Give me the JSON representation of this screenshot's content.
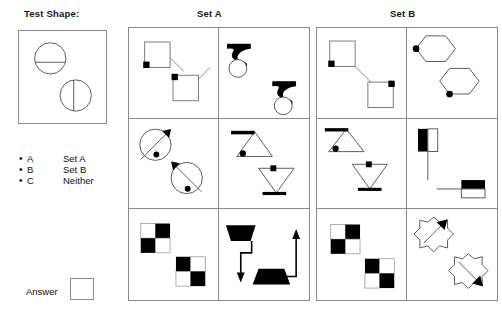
{
  "labels": {
    "test_shape_title": "Test Shape:",
    "set_a_title": "Set A",
    "set_b_title": "Set B",
    "answer_label": "Answer"
  },
  "options": [
    {
      "bullet": "•",
      "letter": "A",
      "text": "Set A"
    },
    {
      "bullet": "•",
      "letter": "B",
      "text": "Set B"
    },
    {
      "bullet": "•",
      "letter": "C",
      "text": "Neither"
    }
  ],
  "answer": {
    "value": ""
  },
  "colors": {
    "stroke": "#8a8a8a",
    "shape_stroke": "#4a4a4a",
    "fill_black": "#000000",
    "fill_white": "#ffffff",
    "text": "#111111",
    "background": "#ffffff"
  },
  "test_shape": {
    "description": "Two circles each divided by a single straight chord line",
    "items": [
      {
        "shape": "circle",
        "divider": "horizontal-chord",
        "position": "upper-left"
      },
      {
        "shape": "circle",
        "divider": "vertical-chord",
        "position": "lower-right"
      }
    ]
  },
  "set_a": {
    "title": "Set A",
    "cells": [
      {
        "id": "a1",
        "shapes": "two open squares, each with a small black square at one corner and a thin diagonal tail line",
        "count": 2
      },
      {
        "id": "a2",
        "shapes": "two solid black hook/lightning glyphs each sitting above an open circle",
        "count": 2
      },
      {
        "id": "a3",
        "shapes": "two circles crossed by a diagonal arrow line with a black dot on the circumference",
        "count": 2
      },
      {
        "id": "a4",
        "shapes": "two triangles (one upright, one inverted) with a thick bar on one side and a black dot at a vertex",
        "count": 2
      },
      {
        "id": "a5",
        "shapes": "two 2x2 checkerboard squares with alternating black and white cells",
        "count": 2
      },
      {
        "id": "a6",
        "shapes": "two solid black trapezoids connected by right-angle arrow lines, one arrow pointing down and one pointing up",
        "count": 2
      }
    ]
  },
  "set_b": {
    "title": "Set B",
    "cells": [
      {
        "id": "b1",
        "shapes": "two open squares with black corner dots joined by a long diagonal connector line",
        "count": 2
      },
      {
        "id": "b2",
        "shapes": "two open hexagons each with a black dot on a vertex",
        "count": 2
      },
      {
        "id": "b3",
        "shapes": "two triangles (one upright, one inverted) with a thick bar on one edge and a black dot at a vertex",
        "count": 2
      },
      {
        "id": "b4",
        "shapes": "two rectangles half filled black with a thin line extending from one side",
        "count": 2
      },
      {
        "id": "b5",
        "shapes": "two 2x2 checkerboard squares with alternating black and white cells",
        "count": 2
      },
      {
        "id": "b6",
        "shapes": "two eight-pointed stars each pierced by a diagonal arrow",
        "count": 2
      }
    ]
  }
}
